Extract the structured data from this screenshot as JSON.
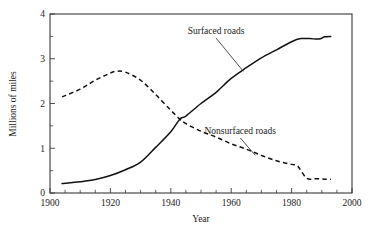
{
  "chart_data": {
    "type": "line",
    "title": "",
    "xlabel": "Year",
    "ylabel": "Millions of miles",
    "xlim": [
      1900,
      2000
    ],
    "ylim": [
      0,
      4
    ],
    "grid": false,
    "legend_position": "inline-annotation",
    "x_ticks": [
      1900,
      1920,
      1940,
      1960,
      1980,
      2000
    ],
    "x_tick_labels": [
      "1900",
      "1920",
      "1940",
      "1960",
      "1980",
      "2000"
    ],
    "x_minor_tick_step": 5,
    "y_ticks": [
      0,
      1,
      2,
      3,
      4
    ],
    "y_tick_labels": [
      "0",
      "1",
      "2",
      "3",
      "4"
    ],
    "y_minor_tick_step": 0.5,
    "annotations": [
      {
        "text": "Surfaced roads",
        "series": "Surfaced roads",
        "label_x": 1955,
        "label_y": 3.55,
        "points_to_x": 1964,
        "points_to_y": 2.72
      },
      {
        "text": "Nonsurfaced roads",
        "series": "Nonsurfaced roads",
        "label_x": 1963,
        "label_y": 1.32,
        "points_to_x": 1968,
        "points_to_y": 0.84
      }
    ],
    "series": [
      {
        "name": "Surfaced roads",
        "style": "solid",
        "color": "#111111",
        "x": [
          1904,
          1910,
          1915,
          1920,
          1925,
          1930,
          1935,
          1940,
          1943,
          1945,
          1950,
          1955,
          1960,
          1965,
          1970,
          1975,
          1980,
          1983,
          1986,
          1989,
          1991,
          1993
        ],
        "values": [
          0.21,
          0.25,
          0.3,
          0.39,
          0.52,
          0.69,
          1.02,
          1.37,
          1.65,
          1.72,
          2.0,
          2.25,
          2.56,
          2.8,
          3.02,
          3.2,
          3.38,
          3.45,
          3.45,
          3.44,
          3.49,
          3.5
        ]
      },
      {
        "name": "Nonsurfaced roads",
        "style": "dashed",
        "color": "#111111",
        "x": [
          1904,
          1910,
          1915,
          1920,
          1922,
          1925,
          1930,
          1935,
          1940,
          1943,
          1945,
          1950,
          1955,
          1960,
          1965,
          1970,
          1975,
          1980,
          1982,
          1985,
          1988,
          1991,
          1993
        ],
        "values": [
          2.15,
          2.32,
          2.52,
          2.68,
          2.72,
          2.7,
          2.52,
          2.2,
          1.85,
          1.65,
          1.55,
          1.38,
          1.25,
          1.1,
          0.98,
          0.84,
          0.72,
          0.64,
          0.6,
          0.33,
          0.32,
          0.31,
          0.31
        ]
      }
    ]
  },
  "colors": {
    "axis": "#3a3a3a",
    "ink": "#111111",
    "background": "#ffffff"
  }
}
